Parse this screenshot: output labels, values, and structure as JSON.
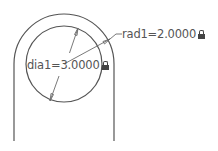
{
  "drawing": {
    "colors": {
      "geometry": "#555555",
      "dimension": "#6a6a6a",
      "text": "#555555",
      "background": "#ffffff"
    },
    "outer_profile": {
      "shape": "slot-end (U shape)",
      "center": [
        64,
        64
      ],
      "radius": 50,
      "left_line_x": 14,
      "right_line_x": 114,
      "line_bottom_y": 141
    },
    "inner_circle": {
      "center": [
        64,
        64
      ],
      "radius": 38
    },
    "dimensions": [
      {
        "id": "dia1",
        "type": "diameter",
        "label": "dia1=3.0000",
        "locked": true,
        "icon": "lock-icon"
      },
      {
        "id": "rad1",
        "type": "radius",
        "label": "rad1=2.0000",
        "locked": true,
        "icon": "lock-icon"
      }
    ]
  }
}
